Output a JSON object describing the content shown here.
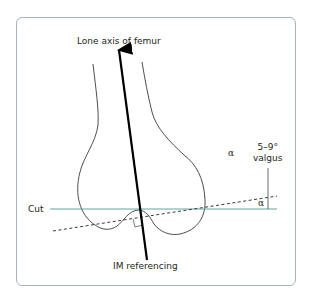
{
  "diagram": {
    "title_label": "Lone axis of femur",
    "cut_label": "Cut",
    "im_label": "IM referencing",
    "alpha_symbol": "α",
    "valgus_angle": "5–9°",
    "valgus_word": "valgus",
    "colors": {
      "frame": "#a9b2bf",
      "cut_line": "#5aa8a2",
      "outline": "#3a3a3a",
      "axis": "#000000",
      "text": "#231f20"
    }
  }
}
